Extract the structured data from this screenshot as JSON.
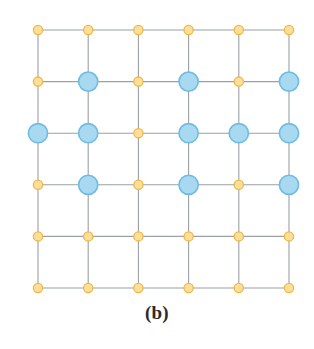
{
  "figure": {
    "caption": "(b)",
    "kind": "square-lattice-diagram",
    "background_color": "#ffffff"
  },
  "lattice": {
    "rows": 6,
    "cols": 6,
    "origin_x": 38,
    "origin_y": 30,
    "step_x": 50.2,
    "step_y": 51.6,
    "edge_color": "#9aa0a6",
    "edge_width": 1.1,
    "plain_node": {
      "name": "plain-site-node",
      "radius": 4.6,
      "fill": "#fcdf9e",
      "stroke": "#f2b83c",
      "stroke_width": 1.3
    },
    "marked_node": {
      "name": "marked-site-node",
      "radius": 9.6,
      "fill": "#a8d9f0",
      "stroke": "#6cbce3",
      "stroke_width": 1.6
    },
    "marked_positions": [
      [
        1,
        1
      ],
      [
        1,
        3
      ],
      [
        1,
        5
      ],
      [
        2,
        0
      ],
      [
        2,
        1
      ],
      [
        2,
        3
      ],
      [
        2,
        4
      ],
      [
        2,
        5
      ],
      [
        3,
        1
      ],
      [
        3,
        3
      ],
      [
        3,
        5
      ]
    ],
    "marked_count": 11,
    "plain_count": 25,
    "total_nodes": 36
  },
  "chart_data": {
    "type": "scatter",
    "title": "(b)",
    "xlabel": "",
    "ylabel": "",
    "xlim": [
      0,
      5
    ],
    "ylim": [
      0,
      5
    ],
    "grid": true,
    "legend": null,
    "categories": [
      "plain",
      "marked"
    ],
    "series": [
      {
        "name": "plain",
        "color": "#fcdf9e",
        "points": [
          [
            0,
            5
          ],
          [
            1,
            5
          ],
          [
            2,
            5
          ],
          [
            3,
            5
          ],
          [
            4,
            5
          ],
          [
            5,
            5
          ],
          [
            0,
            4
          ],
          [
            2,
            4
          ],
          [
            4,
            4
          ],
          [
            2,
            3
          ],
          [
            0,
            2
          ],
          [
            2,
            2
          ],
          [
            4,
            2
          ],
          [
            0,
            1
          ],
          [
            1,
            1
          ],
          [
            2,
            1
          ],
          [
            3,
            1
          ],
          [
            4,
            1
          ],
          [
            5,
            1
          ],
          [
            0,
            0
          ],
          [
            1,
            0
          ],
          [
            2,
            0
          ],
          [
            3,
            0
          ],
          [
            4,
            0
          ],
          [
            5,
            0
          ]
        ]
      },
      {
        "name": "marked",
        "color": "#a8d9f0",
        "points": [
          [
            1,
            4
          ],
          [
            3,
            4
          ],
          [
            5,
            4
          ],
          [
            0,
            3
          ],
          [
            1,
            3
          ],
          [
            3,
            3
          ],
          [
            4,
            3
          ],
          [
            5,
            3
          ],
          [
            1,
            2
          ],
          [
            3,
            2
          ],
          [
            5,
            2
          ]
        ]
      }
    ]
  }
}
